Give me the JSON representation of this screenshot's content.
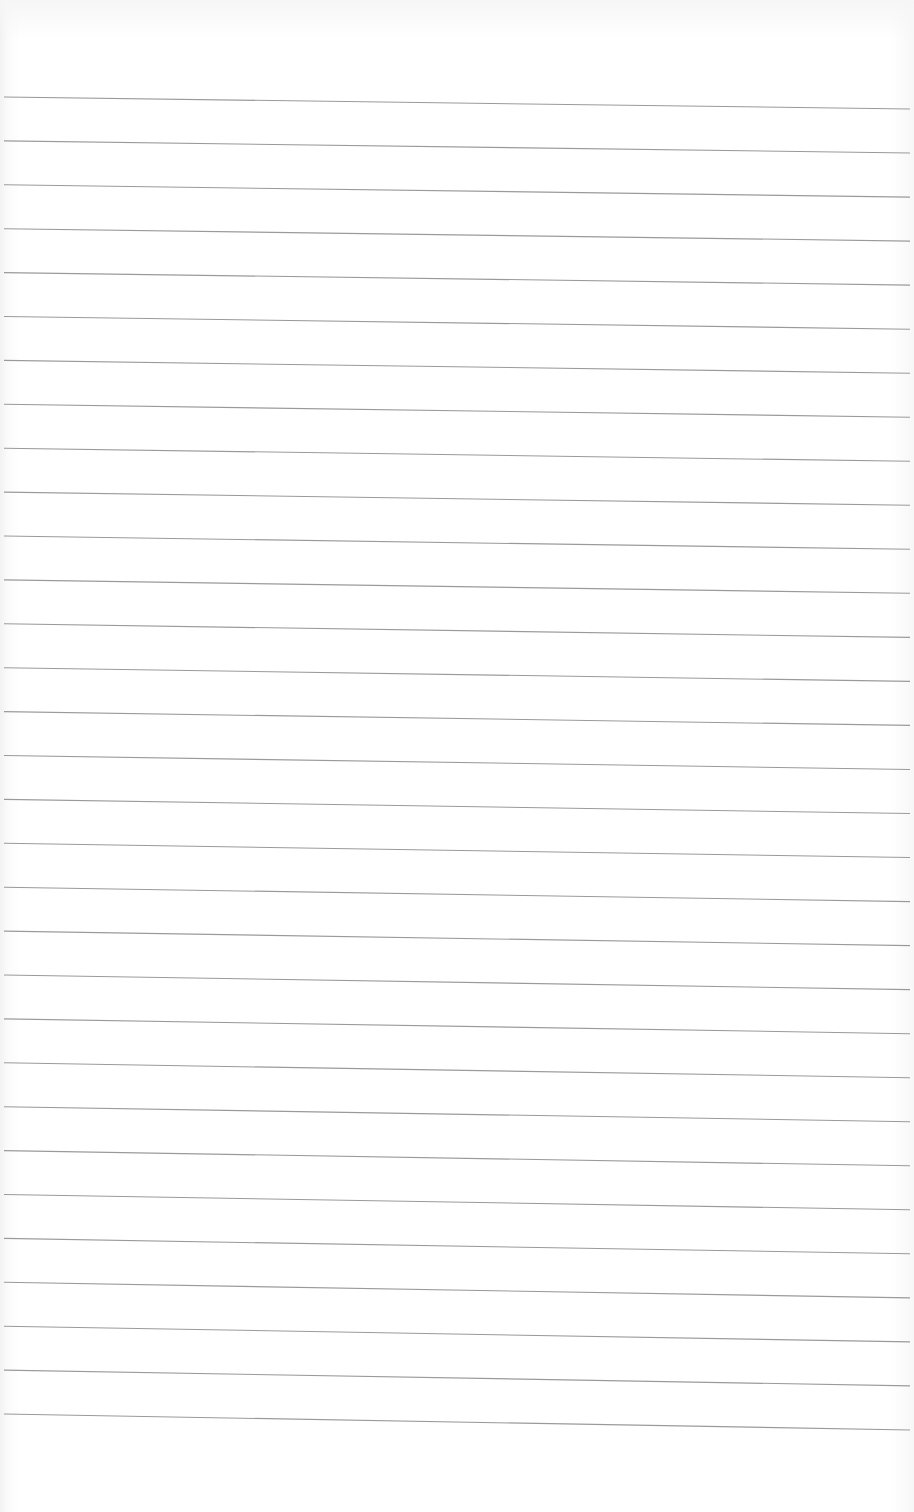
{
  "document": {
    "type": "blank ruled paper page",
    "text_content": "",
    "ruled_lines": {
      "count": 31,
      "color": "#9a9a9a",
      "left_x": 4,
      "right_x": 910,
      "first_line_left_y": 97,
      "first_line_right_y": 109,
      "spacing": 43.9
    },
    "paper_color": "#ffffff"
  }
}
